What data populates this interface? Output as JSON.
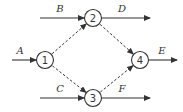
{
  "diagram": {
    "type": "activity-network",
    "colors": {
      "stroke": "#333333",
      "background": "#ffffff"
    },
    "nodes": [
      {
        "id": "1",
        "label": "1",
        "x": 45,
        "y": 60
      },
      {
        "id": "2",
        "label": "2",
        "x": 93,
        "y": 18
      },
      {
        "id": "3",
        "label": "3",
        "x": 93,
        "y": 98
      },
      {
        "id": "4",
        "label": "4",
        "x": 140,
        "y": 60
      }
    ],
    "solid_arrows": [
      {
        "label": "A",
        "to": "1",
        "x1": 12,
        "y1": 60,
        "x2": 36,
        "y2": 60,
        "lx": 20,
        "ly": 54
      },
      {
        "label": "B",
        "to": "2",
        "x1": 40,
        "y1": 18,
        "x2": 84,
        "y2": 18,
        "lx": 60,
        "ly": 12
      },
      {
        "label": "C",
        "to": "3",
        "x1": 40,
        "y1": 98,
        "x2": 84,
        "y2": 98,
        "lx": 60,
        "ly": 92
      },
      {
        "label": "D",
        "from": "2",
        "x1": 102,
        "y1": 18,
        "x2": 150,
        "y2": 18,
        "lx": 122,
        "ly": 12
      },
      {
        "label": "E",
        "from": "4",
        "x1": 149,
        "y1": 60,
        "x2": 177,
        "y2": 60,
        "lx": 162,
        "ly": 54
      },
      {
        "label": "F",
        "from": "3",
        "x1": 102,
        "y1": 98,
        "x2": 150,
        "y2": 98,
        "lx": 122,
        "ly": 92
      }
    ],
    "dashed_arrows": [
      {
        "from": "1",
        "to": "2"
      },
      {
        "from": "1",
        "to": "3"
      },
      {
        "from": "2",
        "to": "4"
      },
      {
        "from": "3",
        "to": "4"
      }
    ]
  }
}
